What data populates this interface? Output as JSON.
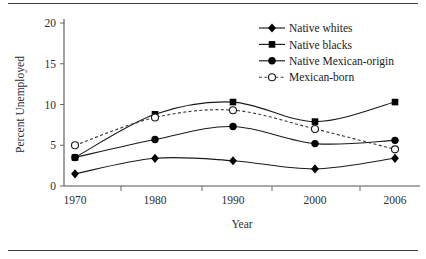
{
  "chart_data": {
    "type": "line",
    "title": "",
    "xlabel": "Year",
    "ylabel": "Percent Unemployed",
    "x": [
      1968,
      1980,
      1990,
      2000,
      2006
    ],
    "categories": [
      "1970",
      "1980",
      "1990",
      "2000",
      "2006"
    ],
    "xtick_labels": [
      "1970",
      "1980",
      "1990",
      "2000",
      "2006"
    ],
    "ytick_labels": [
      "0",
      "5",
      "10",
      "15",
      "20"
    ],
    "ytick_values": [
      0,
      5,
      10,
      15,
      20
    ],
    "ylim": [
      0,
      20
    ],
    "grid": false,
    "legend_position": "top-right",
    "series": [
      {
        "name": "Native whites",
        "marker": "filled-diamond",
        "linestyle": "solid",
        "color": "#000000",
        "values": [
          1.5,
          3.4,
          3.1,
          2.1,
          3.4
        ]
      },
      {
        "name": "Native blacks",
        "marker": "filled-square",
        "linestyle": "solid",
        "color": "#000000",
        "values": [
          3.5,
          8.8,
          10.3,
          7.9,
          10.3
        ]
      },
      {
        "name": "Native Mexican-origin",
        "marker": "filled-circle",
        "linestyle": "solid",
        "color": "#000000",
        "values": [
          3.5,
          5.7,
          7.3,
          5.2,
          5.6
        ]
      },
      {
        "name": "Mexican-born",
        "marker": "open-circle",
        "linestyle": "dashed",
        "color": "#3a3a3a",
        "values": [
          5.0,
          8.4,
          9.3,
          7.0,
          4.5
        ]
      }
    ]
  },
  "legend": {
    "entries": [
      {
        "label": "Native whites"
      },
      {
        "label": "Native blacks"
      },
      {
        "label": "Native Mexican-origin"
      },
      {
        "label": "Mexican-born"
      }
    ]
  },
  "axes": {
    "y_title": "Percent Unemployed",
    "x_title": "Year"
  }
}
